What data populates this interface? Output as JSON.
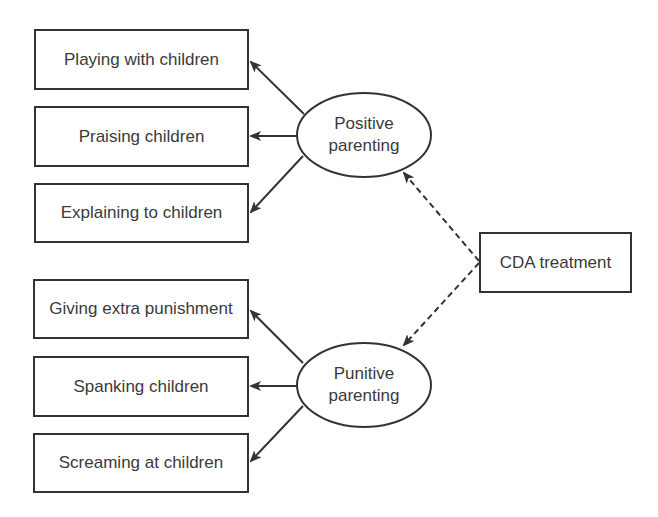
{
  "diagram": {
    "indicators_positive": [
      {
        "label": "Playing with children"
      },
      {
        "label": "Praising children"
      },
      {
        "label": "Explaining to children"
      }
    ],
    "indicators_punitive": [
      {
        "label": "Giving extra punishment"
      },
      {
        "label": "Spanking children"
      },
      {
        "label": "Screaming at children"
      }
    ],
    "latent_positive": {
      "line1": "Positive",
      "line2": "parenting"
    },
    "latent_punitive": {
      "line1": "Punitive",
      "line2": "parenting"
    },
    "treatment": {
      "label": "CDA treatment"
    },
    "colors": {
      "stroke": "#333333",
      "text": "#3a3a3a",
      "background": "#ffffff"
    }
  }
}
